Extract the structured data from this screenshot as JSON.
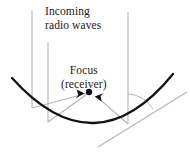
{
  "figure": {
    "kind": "parabolic-reflector-diagram",
    "background_color": "#ffffff",
    "labels": {
      "incoming_line1": "Incoming",
      "incoming_line2": "radio waves",
      "focus_line1": "Focus",
      "focus_line2": "(receiver)"
    },
    "colors": {
      "text": "#1a1a1a",
      "reflector_curve": "#111111",
      "ray_gray": "#b0b0b0",
      "angle_arc": "#b0b0b0",
      "focus_dot": "#111111",
      "arrowhead": "#111111"
    },
    "geometry": {
      "reflector": {
        "name": "parabolic-dish-cross-section",
        "left_end": [
          12,
          78
        ],
        "vertex": [
          95,
          128
        ],
        "right_end": [
          173,
          74
        ],
        "stroke_width": 2.2
      },
      "focus_point": [
        88,
        93
      ],
      "focus_dot_radius": 3.1,
      "incoming_wave_lines": [
        {
          "name": "incoming-ray-left-outer",
          "x": 32,
          "y_top": 10,
          "y_bottom": 108
        },
        {
          "name": "incoming-ray-left-inner",
          "x": 48,
          "y_top": 42,
          "y_bottom": 122
        },
        {
          "name": "incoming-ray-right",
          "x": 128,
          "y_top": 12,
          "y_bottom": 124
        }
      ],
      "reflected_rays": [
        {
          "name": "reflected-ray-from-left-outer",
          "from": [
            32,
            108
          ],
          "to": [
            88,
            93
          ]
        },
        {
          "name": "reflected-ray-from-left-inner",
          "from": [
            48,
            122
          ],
          "to": [
            88,
            93
          ]
        },
        {
          "name": "reflected-ray-from-right",
          "from": [
            128,
            124
          ],
          "to": [
            97,
            96
          ]
        }
      ],
      "arrowheads": [
        {
          "name": "arrowhead-left",
          "tip": [
            85,
            93
          ],
          "angle_deg": 345
        },
        {
          "name": "arrowhead-right",
          "tip": [
            95,
            96
          ],
          "angle_deg": 140
        }
      ],
      "tangent_line": {
        "name": "tangent-at-right-contact",
        "from": [
          98,
          146
        ],
        "to": [
          186,
          93
        ]
      },
      "angle_arc": {
        "name": "angle-of-incidence-arc",
        "center": [
          128,
          124
        ],
        "radius": 30,
        "start_deg": 270,
        "end_deg": 329
      }
    }
  }
}
